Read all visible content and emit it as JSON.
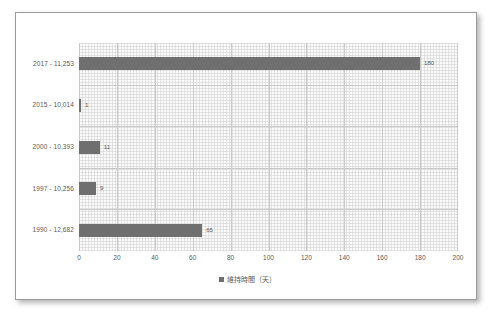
{
  "chart_data": {
    "type": "bar",
    "orientation": "horizontal",
    "title": "",
    "xlabel": "",
    "ylabel": "",
    "xlim": [
      0,
      200
    ],
    "xticks": [
      0,
      20,
      40,
      60,
      80,
      100,
      120,
      140,
      160,
      180,
      200
    ],
    "grid": true,
    "legend_position": "bottom",
    "legend": [
      "維持時間（天）"
    ],
    "categories": [
      "2017 - 11,253",
      "2015 - 10,014",
      "2000 - 10,393",
      "1997 - 10,256",
      "1990 - 12,682"
    ],
    "series": [
      {
        "name": "維持時間（天）",
        "color": "#6f6f6f",
        "values": [
          180,
          1,
          11,
          9,
          65
        ]
      }
    ],
    "data_labels": [
      "180",
      "1",
      "11",
      "9",
      "65"
    ]
  },
  "legend": {
    "marker": "square-marker",
    "label": "維持時間（天）"
  }
}
